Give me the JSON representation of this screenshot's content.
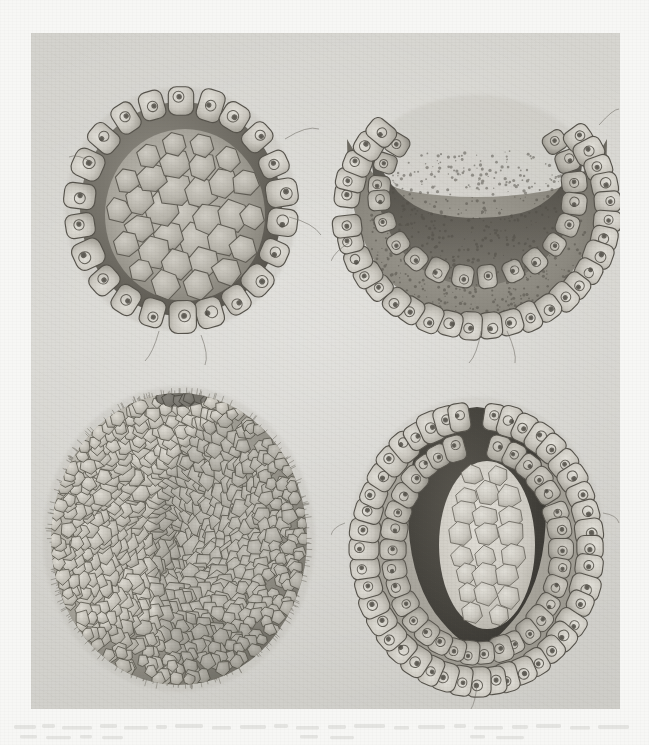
{
  "document": {
    "kind": "scientific-illustration-plate",
    "subject": "embryonic development stages",
    "medium": "engraved / lithographic plate on aged paper",
    "paper_color": "#f7f7f5",
    "plate_color": "#d8d7d2",
    "ink_color": "#4a4740",
    "caption": "",
    "plate_number": ""
  },
  "plate": {
    "figures": [
      {
        "id": "fig-1",
        "position": "top-left",
        "name": "blastula-section",
        "description": "sectioned spherical blastula with single outer layer of columnar cells surrounding an inner mass of large polygonal cells",
        "label": "",
        "outer_cells": 22,
        "inner_cells": 26,
        "shape": "sphere-section"
      },
      {
        "id": "fig-2",
        "position": "top-right",
        "name": "early-gastrula-section",
        "description": "sectioned early gastrula showing invagination of the upper wall forming a crescent-shaped archenteron cavity",
        "label": "",
        "outer_cells": 38,
        "inner_cells": 0,
        "shape": "crescent-invagination"
      },
      {
        "id": "fig-3",
        "position": "bottom-left",
        "name": "blastula-surface-view",
        "description": "whole ovoid blastula viewed from the exterior, surface entirely covered with small polygonal blastomeres",
        "label": "",
        "outer_cells": 320,
        "inner_cells": 0,
        "shape": "ovoid-whole"
      },
      {
        "id": "fig-4",
        "position": "bottom-right",
        "name": "late-gastrula-section",
        "description": "sectioned late gastrula with deep archenteron, two cell layers and a central mass of pale endoderm cells",
        "label": "",
        "outer_cells": 46,
        "inner_cells": 28,
        "shape": "deep-invagination"
      }
    ]
  }
}
